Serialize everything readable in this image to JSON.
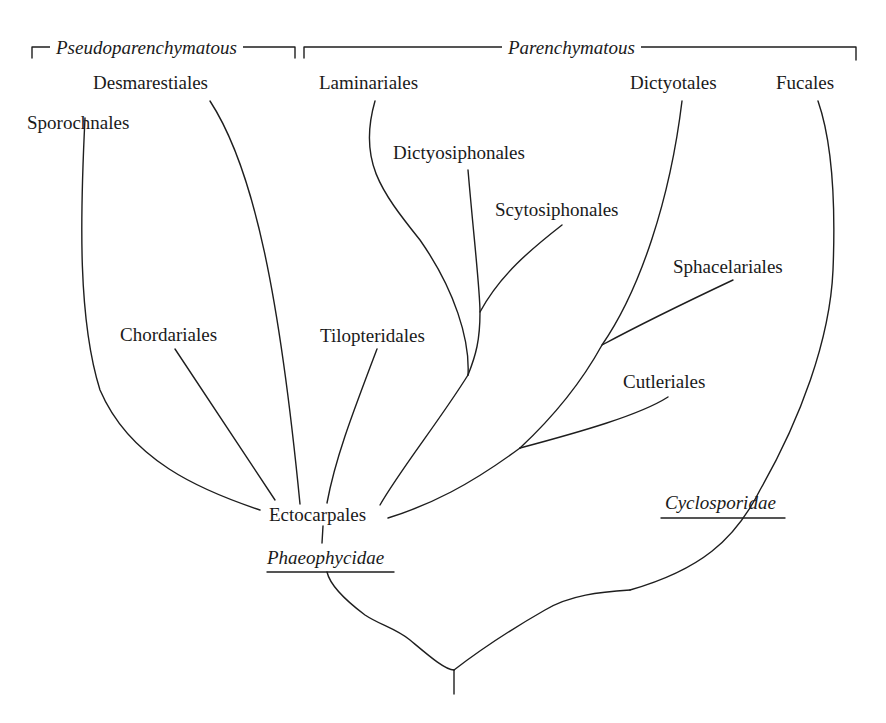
{
  "diagram": {
    "type": "phylogenetic-tree",
    "groups": [
      {
        "id": "pseudo",
        "label": "Pseudoparenchymatous"
      },
      {
        "id": "paren",
        "label": "Parenchymatous"
      }
    ],
    "orders": {
      "sporochnales": "Sporochnales",
      "desmarestiales": "Desmarestiales",
      "laminariales": "Laminariales",
      "dictyosiphonales": "Dictyosiphonales",
      "scytosiphonales": "Scytosiphonales",
      "dictyotales": "Dictyotales",
      "fucales": "Fucales",
      "sphacelariales": "Sphacelariales",
      "chordariales": "Chordariales",
      "tilopteridales": "Tilopteridales",
      "cutleriales": "Cutleriales",
      "ectocarpales": "Ectocarpales"
    },
    "clades": {
      "phaeophycidae": "Phaeophycidae",
      "cyclosporidae": "Cyclosporidae"
    },
    "edges": [
      [
        "Ectocarpales",
        "Sporochnales"
      ],
      [
        "Ectocarpales",
        "Chordariales"
      ],
      [
        "Ectocarpales",
        "Desmarestiales"
      ],
      [
        "Ectocarpales",
        "Tilopteridales"
      ],
      [
        "Ectocarpales",
        "Laminariales"
      ],
      [
        "Ectocarpales",
        "Dictyosiphonales"
      ],
      [
        "Dictyosiphonales",
        "Scytosiphonales"
      ],
      [
        "Ectocarpales",
        "Dictyotales"
      ],
      [
        "Dictyotales",
        "Sphacelariales"
      ],
      [
        "Ectocarpales",
        "Cutleriales"
      ],
      [
        "Ectocarpales",
        "Phaeophycidae"
      ],
      [
        "Root",
        "Phaeophycidae"
      ],
      [
        "Root",
        "Cyclosporidae"
      ],
      [
        "Cyclosporidae",
        "Fucales"
      ]
    ],
    "colors": {
      "line": "#1e1e1e",
      "text": "#1a1a1a",
      "background": "#ffffff"
    }
  }
}
